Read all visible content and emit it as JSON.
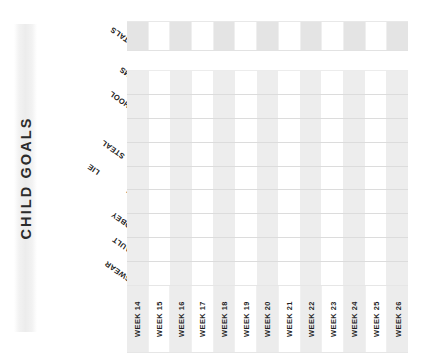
{
  "sheet": {
    "title": "CHILD GOALS",
    "totals_label": "TOTALS"
  },
  "goals": [
    {
      "label": "TANTRUMS"
    },
    {
      "label": "SCHOOL"
    },
    {
      "label": "FIGHT WITH SIBLINGS"
    },
    {
      "label": "STEAL"
    },
    {
      "label": "LIE"
    },
    {
      "label": "DISRESPECT"
    },
    {
      "label": "DISOBEY"
    },
    {
      "label": "ASSAULT"
    },
    {
      "label": "SWEAR"
    }
  ],
  "weeks": [
    {
      "label": "WEEK 14",
      "shaded": true
    },
    {
      "label": "WEEK 15",
      "shaded": false
    },
    {
      "label": "WEEK 16",
      "shaded": true
    },
    {
      "label": "WEEK 17",
      "shaded": false
    },
    {
      "label": "WEEK 18",
      "shaded": true
    },
    {
      "label": "WEEK 19",
      "shaded": false
    },
    {
      "label": "WEEK 20",
      "shaded": true
    },
    {
      "label": "WEEK 21",
      "shaded": false
    },
    {
      "label": "WEEK 22",
      "shaded": true
    },
    {
      "label": "WEEK 23",
      "shaded": false
    },
    {
      "label": "WEEK 24",
      "shaded": true
    },
    {
      "label": "WEEK 25",
      "shaded": false
    },
    {
      "label": "WEEK 26",
      "shaded": true
    }
  ],
  "colors": {
    "shaded_cell": "#ededed",
    "totals_shaded_cell": "#e4e4e4",
    "plain_cell": "#ffffff",
    "row_divider": "#dcdcdc",
    "text": "#1f1f1f"
  },
  "entries": {
    "note": "All goal cells are blank (unfilled tracker)."
  }
}
